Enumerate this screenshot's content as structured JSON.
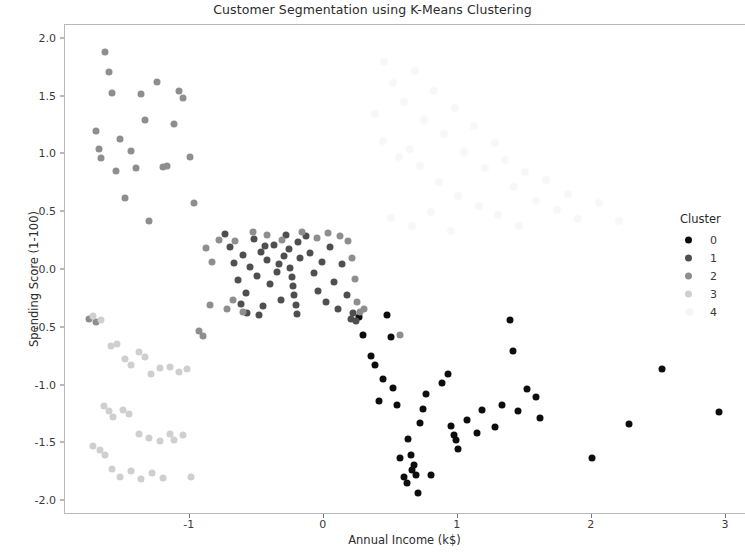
{
  "chart_data": {
    "type": "scatter",
    "title": "Customer Segmentation using K-Means Clustering",
    "xlabel": "Annual Income (k$)",
    "ylabel": "Spending Score (1-100)",
    "xlim": [
      -1.93,
      3.15
    ],
    "ylim": [
      -2.12,
      2.12
    ],
    "xticks": [
      -1,
      0,
      1,
      2,
      3
    ],
    "xticklabels": [
      "-1",
      "0",
      "1",
      "2",
      "3"
    ],
    "yticks": [
      -2.0,
      -1.5,
      -1.0,
      -0.5,
      0.0,
      0.5,
      1.0,
      1.5,
      2.0
    ],
    "yticklabels": [
      "-2.0",
      "-1.5",
      "-1.0",
      "-0.5",
      "0.0",
      "0.5",
      "1.0",
      "1.5",
      "2.0"
    ],
    "grid": false,
    "marker_size": 7,
    "legend": {
      "title": "Cluster",
      "position": "right-inside",
      "entries": [
        {
          "label": "0",
          "color": "#0d0d0d"
        },
        {
          "label": "1",
          "color": "#4f4f4f"
        },
        {
          "label": "2",
          "color": "#8e8e8e"
        },
        {
          "label": "3",
          "color": "#cfcfcf"
        },
        {
          "label": "4",
          "color": "#f4f4f4"
        }
      ]
    },
    "series": [
      {
        "name": "0",
        "color": "#0d0d0d",
        "points": [
          [
            0.26,
            -0.41
          ],
          [
            0.29,
            -0.56
          ],
          [
            0.38,
            -0.82
          ],
          [
            0.47,
            -0.39
          ],
          [
            0.5,
            -0.58
          ],
          [
            0.52,
            -1.02
          ],
          [
            0.55,
            -1.17
          ],
          [
            0.57,
            -1.63
          ],
          [
            0.6,
            -1.79
          ],
          [
            0.62,
            -1.84
          ],
          [
            0.63,
            -1.46
          ],
          [
            0.65,
            -1.6
          ],
          [
            0.67,
            -1.69
          ],
          [
            0.66,
            -1.73
          ],
          [
            0.69,
            -1.77
          ],
          [
            0.7,
            -1.93
          ],
          [
            0.72,
            -1.32
          ],
          [
            0.74,
            -1.2
          ],
          [
            0.76,
            -1.07
          ],
          [
            0.8,
            -1.77
          ],
          [
            0.88,
            -0.98
          ],
          [
            0.93,
            -0.9
          ],
          [
            0.95,
            -1.35
          ],
          [
            0.97,
            -1.43
          ],
          [
            0.99,
            -1.47
          ],
          [
            1.0,
            -1.55
          ],
          [
            1.07,
            -1.3
          ],
          [
            1.14,
            -1.41
          ],
          [
            1.18,
            -1.21
          ],
          [
            1.28,
            -1.36
          ],
          [
            1.33,
            -1.17
          ],
          [
            1.39,
            -0.43
          ],
          [
            1.41,
            -0.7
          ],
          [
            1.45,
            -1.22
          ],
          [
            1.52,
            -1.03
          ],
          [
            1.58,
            -1.1
          ],
          [
            1.61,
            -1.28
          ],
          [
            2.0,
            -1.63
          ],
          [
            2.28,
            -1.33
          ],
          [
            2.52,
            -0.86
          ],
          [
            2.95,
            -1.23
          ],
          [
            0.44,
            -0.94
          ],
          [
            0.41,
            -1.13
          ],
          [
            0.35,
            -0.74
          ]
        ]
      },
      {
        "name": "1",
        "color": "#4f4f4f",
        "points": [
          [
            -0.74,
            0.31
          ],
          [
            -0.7,
            0.2
          ],
          [
            -0.67,
            0.06
          ],
          [
            -0.64,
            -0.09
          ],
          [
            -0.6,
            0.13
          ],
          [
            -0.58,
            -0.2
          ],
          [
            -0.55,
            0.03
          ],
          [
            -0.52,
            0.27
          ],
          [
            -0.5,
            -0.05
          ],
          [
            -0.47,
            0.16
          ],
          [
            -0.45,
            -0.31
          ],
          [
            -0.42,
            0.09
          ],
          [
            -0.4,
            -0.12
          ],
          [
            -0.37,
            0.22
          ],
          [
            -0.35,
            -0.02
          ],
          [
            -0.32,
            -0.26
          ],
          [
            -0.3,
            0.12
          ],
          [
            -0.28,
            0.3
          ],
          [
            -0.26,
            0.18
          ],
          [
            -0.25,
            0.02
          ],
          [
            -0.24,
            -0.06
          ],
          [
            -0.23,
            -0.14
          ],
          [
            -0.22,
            -0.22
          ],
          [
            -0.21,
            -0.3
          ],
          [
            -0.2,
            -0.38
          ],
          [
            -0.19,
            0.24
          ],
          [
            -0.18,
            0.1
          ],
          [
            -0.13,
            0.29
          ],
          [
            -0.1,
            0.15
          ],
          [
            -0.07,
            -0.03
          ],
          [
            -0.04,
            -0.18
          ],
          [
            -0.01,
            0.07
          ],
          [
            0.02,
            -0.28
          ],
          [
            0.05,
            0.2
          ],
          [
            0.08,
            -0.1
          ],
          [
            0.11,
            -0.34
          ],
          [
            0.14,
            0.05
          ],
          [
            0.17,
            -0.22
          ],
          [
            0.2,
            -0.42
          ],
          [
            0.22,
            -0.37
          ],
          [
            0.24,
            -0.44
          ],
          [
            -0.62,
            -0.29
          ],
          [
            -0.57,
            -0.37
          ],
          [
            -0.48,
            -0.39
          ],
          [
            -0.33,
            0.05
          ],
          [
            -0.44,
            0.21
          ]
        ]
      },
      {
        "name": "2",
        "color": "#8e8e8e",
        "points": [
          [
            -1.7,
            1.2
          ],
          [
            -1.68,
            1.05
          ],
          [
            -1.66,
            0.97
          ],
          [
            -1.63,
            1.89
          ],
          [
            -1.6,
            1.71
          ],
          [
            -1.58,
            1.53
          ],
          [
            -1.55,
            0.86
          ],
          [
            -1.52,
            1.13
          ],
          [
            -1.48,
            0.62
          ],
          [
            -1.44,
            1.03
          ],
          [
            -1.4,
            0.88
          ],
          [
            -1.36,
            1.52
          ],
          [
            -1.33,
            1.3
          ],
          [
            -1.3,
            0.42
          ],
          [
            -1.24,
            1.63
          ],
          [
            -1.2,
            0.89
          ],
          [
            -1.17,
            0.9
          ],
          [
            -1.12,
            1.26
          ],
          [
            -1.08,
            1.55
          ],
          [
            -1.05,
            1.49
          ],
          [
            -1.0,
            0.98
          ],
          [
            -0.97,
            0.58
          ],
          [
            -0.93,
            -0.53
          ],
          [
            -0.9,
            -0.57
          ],
          [
            -0.88,
            0.19
          ],
          [
            -0.85,
            -0.3
          ],
          [
            -0.83,
            0.07
          ],
          [
            -0.78,
            0.26
          ],
          [
            -0.66,
            0.25
          ],
          [
            -0.53,
            0.33
          ],
          [
            -0.42,
            0.3
          ],
          [
            -0.31,
            0.26
          ],
          [
            -0.16,
            0.33
          ],
          [
            -0.05,
            0.28
          ],
          [
            0.03,
            0.32
          ],
          [
            0.12,
            0.29
          ],
          [
            0.18,
            0.25
          ],
          [
            0.21,
            0.1
          ],
          [
            0.23,
            -0.08
          ],
          [
            0.25,
            -0.28
          ],
          [
            0.27,
            -0.36
          ],
          [
            0.3,
            -0.34
          ],
          [
            -0.72,
            -0.34
          ],
          [
            -0.68,
            -0.26
          ],
          [
            0.57,
            -0.56
          ],
          [
            -0.6,
            -0.36
          ],
          [
            -1.75,
            -0.42
          ],
          [
            -1.7,
            -0.45
          ]
        ]
      },
      {
        "name": "3",
        "color": "#cfcfcf",
        "points": [
          [
            -1.72,
            -0.4
          ],
          [
            -1.66,
            -0.43
          ],
          [
            -1.59,
            -0.66
          ],
          [
            -1.54,
            -0.64
          ],
          [
            -1.48,
            -0.77
          ],
          [
            -1.44,
            -0.82
          ],
          [
            -1.38,
            -0.71
          ],
          [
            -1.33,
            -0.75
          ],
          [
            -1.29,
            -0.9
          ],
          [
            -1.22,
            -0.85
          ],
          [
            -1.15,
            -0.84
          ],
          [
            -1.08,
            -0.88
          ],
          [
            -1.02,
            -0.86
          ],
          [
            -1.64,
            -1.18
          ],
          [
            -1.6,
            -1.22
          ],
          [
            -1.57,
            -1.27
          ],
          [
            -1.5,
            -1.21
          ],
          [
            -1.45,
            -1.25
          ],
          [
            -1.38,
            -1.42
          ],
          [
            -1.3,
            -1.45
          ],
          [
            -1.22,
            -1.48
          ],
          [
            -1.15,
            -1.42
          ],
          [
            -1.72,
            -1.52
          ],
          [
            -1.67,
            -1.56
          ],
          [
            -1.63,
            -1.6
          ],
          [
            -1.58,
            -1.72
          ],
          [
            -1.52,
            -1.79
          ],
          [
            -1.44,
            -1.74
          ],
          [
            -1.36,
            -1.81
          ],
          [
            -1.28,
            -1.76
          ],
          [
            -1.2,
            -1.8
          ],
          [
            -1.12,
            -1.47
          ],
          [
            -1.05,
            -1.43
          ],
          [
            -0.99,
            -1.79
          ]
        ]
      },
      {
        "name": "4",
        "color": "#f7f7f7",
        "points": [
          [
            0.45,
            1.8
          ],
          [
            0.52,
            1.62
          ],
          [
            0.6,
            1.45
          ],
          [
            0.68,
            1.72
          ],
          [
            0.75,
            1.3
          ],
          [
            0.82,
            1.55
          ],
          [
            0.9,
            1.18
          ],
          [
            0.98,
            1.4
          ],
          [
            1.05,
            1.02
          ],
          [
            1.12,
            1.25
          ],
          [
            1.2,
            0.88
          ],
          [
            1.28,
            1.1
          ],
          [
            1.35,
            0.95
          ],
          [
            1.42,
            0.72
          ],
          [
            1.5,
            0.85
          ],
          [
            1.58,
            0.6
          ],
          [
            1.66,
            0.78
          ],
          [
            1.74,
            0.52
          ],
          [
            1.82,
            0.66
          ],
          [
            1.9,
            0.44
          ],
          [
            0.38,
            1.35
          ],
          [
            0.44,
            1.12
          ],
          [
            0.56,
            0.98
          ],
          [
            0.64,
            1.05
          ],
          [
            0.72,
            0.9
          ],
          [
            0.86,
            0.76
          ],
          [
            1.0,
            0.64
          ],
          [
            1.16,
            0.55
          ],
          [
            1.3,
            0.48
          ],
          [
            1.46,
            0.38
          ],
          [
            2.05,
            0.58
          ],
          [
            2.2,
            0.42
          ],
          [
            0.5,
            0.45
          ],
          [
            0.66,
            0.38
          ],
          [
            0.8,
            0.5
          ],
          [
            0.95,
            0.34
          ]
        ]
      }
    ]
  }
}
